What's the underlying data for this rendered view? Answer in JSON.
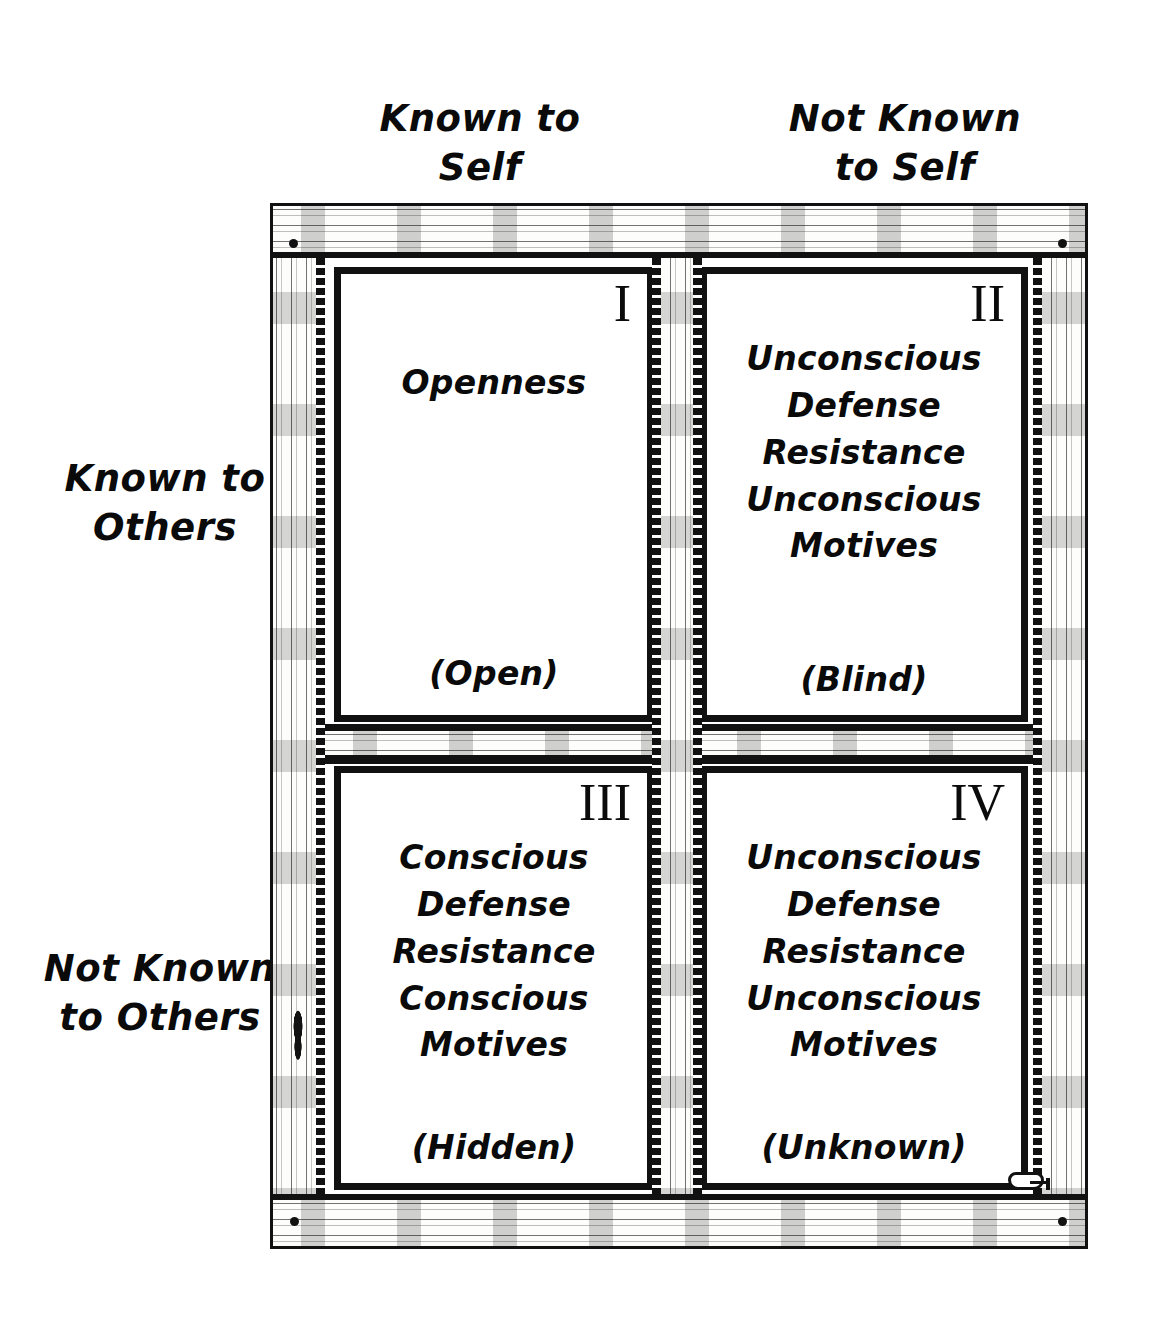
{
  "diagram": {
    "column_headers": [
      {
        "id": "known-to-self",
        "line1": "Known to",
        "line2": "Self"
      },
      {
        "id": "not-known-to-self",
        "line1": "Not Known",
        "line2": "to Self"
      }
    ],
    "row_headers": [
      {
        "id": "known-to-others",
        "line1": "Known to",
        "line2": "Others"
      },
      {
        "id": "not-known-to-others",
        "line1": "Not Known",
        "line2": "to Others"
      }
    ],
    "quadrants": [
      {
        "id": "quadrant-open",
        "numeral": "I",
        "lines": [
          "Openness"
        ],
        "caption": "(Open)"
      },
      {
        "id": "quadrant-blind",
        "numeral": "II",
        "lines": [
          "Unconscious",
          "Defense",
          "Resistance",
          "Unconscious",
          "Motives"
        ],
        "caption": "(Blind)"
      },
      {
        "id": "quadrant-hidden",
        "numeral": "III",
        "lines": [
          "Conscious",
          "Defense",
          "Resistance",
          "Conscious",
          "Motives"
        ],
        "caption": "(Hidden)"
      },
      {
        "id": "quadrant-unknown",
        "numeral": "IV",
        "lines": [
          "Unconscious",
          "Defense",
          "Resistance",
          "Unconscious",
          "Motives"
        ],
        "caption": "(Unknown)"
      }
    ],
    "colors": {
      "ink": "#0a0a0a",
      "paper": "#ffffff",
      "frame": "#111111"
    },
    "decorations": [
      "nail-top-left",
      "nail-top-right",
      "nail-bottom-left",
      "nail-bottom-right",
      "wood-knot-left-stile",
      "window-latch-bottom"
    ]
  }
}
